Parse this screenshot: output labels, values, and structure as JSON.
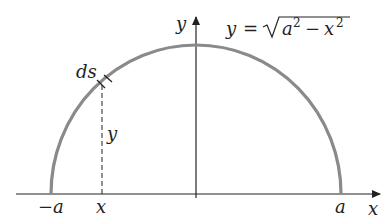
{
  "diagram": {
    "type": "semicircle-arc-length",
    "equation": {
      "lhs": "y",
      "eq": "=",
      "radicand_a": "a",
      "radicand_a_exp": "2",
      "minus": "−",
      "radicand_x": "x",
      "radicand_x_exp": "2"
    },
    "labels": {
      "x_axis": "x",
      "y_axis": "y",
      "neg_a": "−a",
      "pos_a": "a",
      "x_point": "x",
      "y_height": "y",
      "ds": "ds"
    },
    "colors": {
      "curve": "#8a8a8a",
      "axes": "#222222",
      "text": "#222222"
    }
  }
}
